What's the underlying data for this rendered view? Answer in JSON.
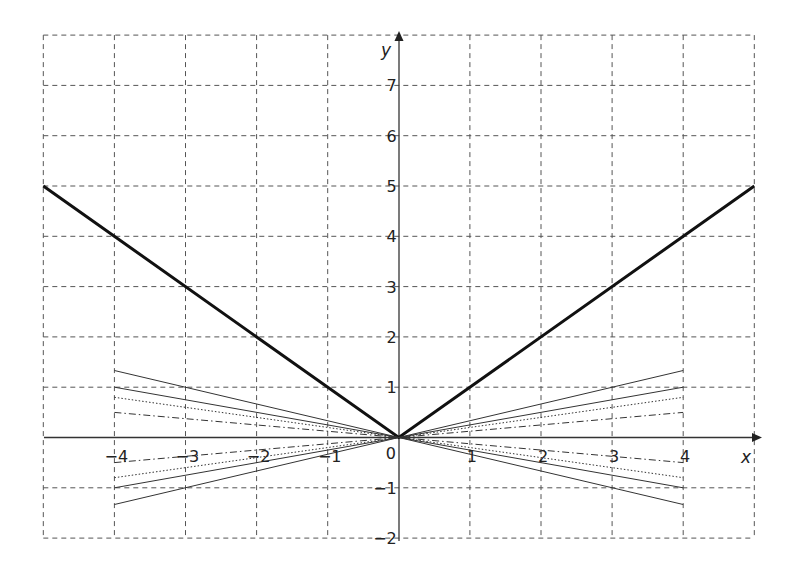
{
  "chart_data": {
    "type": "line",
    "title": "",
    "xlabel": "x",
    "ylabel": "y",
    "xlim": [
      -5,
      5
    ],
    "ylim": [
      -2,
      8
    ],
    "grid": true,
    "grid_style": "dashed",
    "x_ticks": [
      -4,
      -3,
      -2,
      -1,
      0,
      1,
      2,
      3,
      4
    ],
    "x_tick_labels": [
      "−4",
      "−3",
      "−2",
      "−1",
      "0",
      "1",
      "2",
      "3",
      "4"
    ],
    "y_ticks": [
      -2,
      -1,
      1,
      2,
      3,
      4,
      5,
      6,
      7
    ],
    "y_tick_labels": [
      "−2",
      "−1",
      "1",
      "2",
      "3",
      "4",
      "5",
      "6",
      "7"
    ],
    "legend": null,
    "series": [
      {
        "name": "y = |x|",
        "style": "solid-thick",
        "x": [
          -5,
          0,
          5
        ],
        "y": [
          5,
          0,
          5
        ]
      },
      {
        "name": "y = x/3",
        "style": "solid",
        "x": [
          -4,
          4
        ],
        "y": [
          -1.333,
          1.333
        ]
      },
      {
        "name": "y = -x/3",
        "style": "solid",
        "x": [
          -4,
          4
        ],
        "y": [
          1.333,
          -1.333
        ]
      },
      {
        "name": "y = x/4",
        "style": "solid",
        "x": [
          -4,
          4
        ],
        "y": [
          -1,
          1
        ]
      },
      {
        "name": "y = -x/4",
        "style": "solid",
        "x": [
          -4,
          4
        ],
        "y": [
          1,
          -1
        ]
      },
      {
        "name": "y = x/5",
        "style": "dotted",
        "x": [
          -4,
          4
        ],
        "y": [
          -0.8,
          0.8
        ]
      },
      {
        "name": "y = -x/5",
        "style": "dotted",
        "x": [
          -4,
          4
        ],
        "y": [
          0.8,
          -0.8
        ]
      },
      {
        "name": "y = x/8",
        "style": "dash-dot",
        "x": [
          -4,
          4
        ],
        "y": [
          -0.5,
          0.5
        ]
      },
      {
        "name": "y = -x/8",
        "style": "dash-dot",
        "x": [
          -4,
          4
        ],
        "y": [
          0.5,
          -0.5
        ]
      }
    ]
  },
  "labels": {
    "x_axis": "x",
    "y_axis": "y",
    "origin": "0"
  }
}
